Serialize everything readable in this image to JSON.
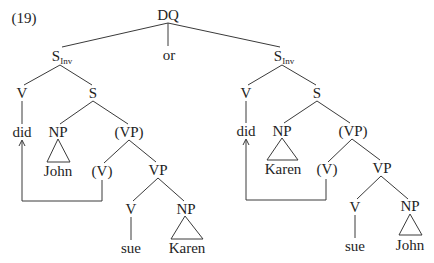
{
  "example_number": "(19)",
  "root": "DQ",
  "conjunction": "or",
  "left_tree": {
    "s_inv": {
      "base": "S",
      "subscript": "Inv"
    },
    "v": "V",
    "s": "S",
    "did": "did",
    "np_subject": "NP",
    "vp_trace": "(VP)",
    "subject": "John",
    "v_trace": "(V)",
    "vp": "VP",
    "v_inner": "V",
    "np_object": "NP",
    "verb": "sue",
    "object": "Karen"
  },
  "right_tree": {
    "s_inv": {
      "base": "S",
      "subscript": "Inv"
    },
    "v": "V",
    "s": "S",
    "did": "did",
    "np_subject": "NP",
    "vp_trace": "(VP)",
    "subject": "Karen",
    "v_trace": "(V)",
    "vp": "VP",
    "v_inner": "V",
    "np_object": "NP",
    "verb": "sue",
    "object": "John"
  }
}
